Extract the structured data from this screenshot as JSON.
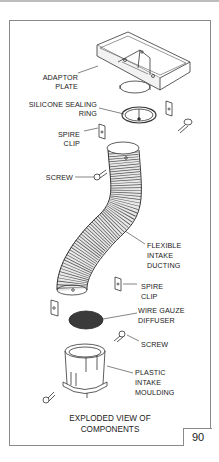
{
  "figure": {
    "number": "90",
    "caption_line1": "EXPLODED VIEW OF",
    "caption_line2": "COMPONENTS"
  },
  "labels": {
    "adaptor_plate_1": "ADAPTOR",
    "adaptor_plate_2": "PLATE",
    "silicone_ring_1": "SILICONE SEALING",
    "silicone_ring_2": "RING",
    "spire_clip_top_1": "SPIRE",
    "spire_clip_top_2": "CLIP",
    "screw_top": "SCREW",
    "ducting_1": "FLEXIBLE",
    "ducting_2": "INTAKE",
    "ducting_3": "DUCTING",
    "spire_clip_mid_1": "SPIRE",
    "spire_clip_mid_2": "CLIP",
    "gauze_1": "WIRE GAUZE",
    "gauze_2": "DIFFUSER",
    "screw_bottom": "SCREW",
    "moulding_1": "PLASTIC",
    "moulding_2": "INTAKE",
    "moulding_3": "MOULDING"
  },
  "colors": {
    "line": "#333333",
    "frame": "#8a8a8a",
    "gauze": "#3a3a3a"
  }
}
